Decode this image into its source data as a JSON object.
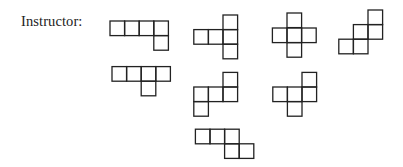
{
  "label": "Instructor:",
  "cell_size": 14.6,
  "stroke_color": "#222222",
  "shapes": [
    {
      "name": "shape-1",
      "cells": [
        [
          110,
          21
        ],
        [
          124.6,
          21
        ],
        [
          139.2,
          21
        ],
        [
          153.8,
          21
        ],
        [
          153.8,
          35.6
        ]
      ]
    },
    {
      "name": "shape-2",
      "cells": [
        [
          223,
          15
        ],
        [
          193.8,
          29.6
        ],
        [
          208.4,
          29.6
        ],
        [
          223,
          29.6
        ],
        [
          223,
          44.2
        ]
      ]
    },
    {
      "name": "shape-3",
      "cells": [
        [
          287,
          13
        ],
        [
          272.4,
          28
        ],
        [
          287,
          28
        ],
        [
          301.6,
          28
        ],
        [
          287,
          42.6
        ]
      ]
    },
    {
      "name": "shape-4",
      "cells": [
        [
          368,
          10
        ],
        [
          353.4,
          24.6
        ],
        [
          368,
          24.6
        ],
        [
          338.8,
          39.2
        ],
        [
          353.4,
          39.2
        ]
      ]
    },
    {
      "name": "shape-5",
      "cells": [
        [
          112,
          66.6
        ],
        [
          126.6,
          66.6
        ],
        [
          141.2,
          66.6
        ],
        [
          155.8,
          66.6
        ],
        [
          141.2,
          81.2
        ]
      ]
    },
    {
      "name": "shape-6",
      "cells": [
        [
          223,
          72.4
        ],
        [
          193.8,
          87
        ],
        [
          208.4,
          87
        ],
        [
          223,
          87
        ],
        [
          193.8,
          101.6
        ]
      ]
    },
    {
      "name": "shape-7",
      "cells": [
        [
          302,
          72.4
        ],
        [
          272.8,
          87
        ],
        [
          287.4,
          87
        ],
        [
          302,
          87
        ],
        [
          287.4,
          101.6
        ]
      ]
    },
    {
      "name": "shape-8",
      "cells": [
        [
          195.4,
          129.2
        ],
        [
          210,
          129.2
        ],
        [
          224.6,
          129.2
        ],
        [
          224.6,
          143.8
        ],
        [
          239.2,
          143.8
        ]
      ]
    }
  ]
}
